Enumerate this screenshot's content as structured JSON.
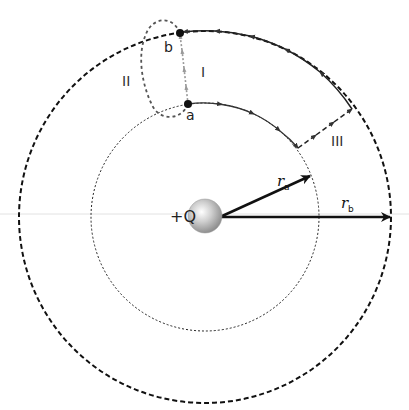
{
  "charge": {
    "label": "+Q",
    "color": "#c8c8c8"
  },
  "points": {
    "a": "a",
    "b": "b"
  },
  "paths": {
    "I": "I",
    "II": "II",
    "III": "III"
  },
  "radii": {
    "ra": {
      "symbol": "r",
      "sub": "a"
    },
    "rb": {
      "symbol": "r",
      "sub": "b"
    }
  },
  "colors": {
    "line": "#111111",
    "path_I": "#888888",
    "path_II": "#555555",
    "background_rule": "#dddddd"
  }
}
